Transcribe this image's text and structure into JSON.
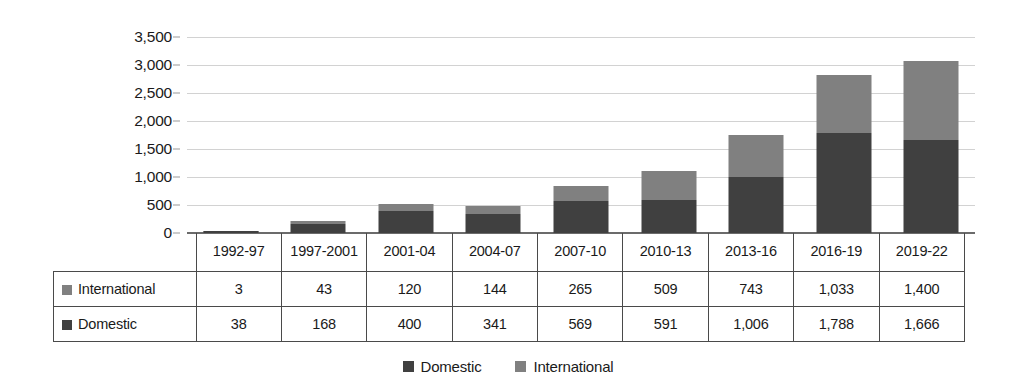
{
  "chart_data": {
    "type": "bar",
    "subtype": "stacked-column",
    "title": "",
    "subtitle": "",
    "xlabel": "",
    "ylabel": "",
    "categories": [
      "1992-97",
      "1997-2001",
      "2001-04",
      "2004-07",
      "2007-10",
      "2010-13",
      "2013-16",
      "2016-19",
      "2019-22"
    ],
    "series": [
      {
        "name": "Domestic",
        "color": "#404040",
        "values": [
          38,
          168,
          400,
          341,
          569,
          591,
          1006,
          1788,
          1666
        ],
        "labels": [
          "38",
          "168",
          "400",
          "341",
          "569",
          "591",
          "1,006",
          "1,788",
          "1,666"
        ]
      },
      {
        "name": "International",
        "color": "#808080",
        "values": [
          3,
          43,
          120,
          144,
          265,
          509,
          743,
          1033,
          1400
        ],
        "labels": [
          "3",
          "43",
          "120",
          "144",
          "265",
          "509",
          "743",
          "1,033",
          "1,400"
        ]
      }
    ],
    "totals": [
      41,
      211,
      520,
      485,
      834,
      1100,
      1749,
      2821,
      3066
    ],
    "ylim": [
      0,
      3500
    ],
    "y_ticks": [
      0,
      500,
      1000,
      1500,
      2000,
      2500,
      3000,
      3500
    ],
    "y_tick_labels": [
      "0",
      "500",
      "1,000",
      "1,500",
      "2,000",
      "2,500",
      "3,000",
      "3,500"
    ],
    "grid": true,
    "grid_axis": "y",
    "legend_position": "bottom",
    "stack_order_bottom_to_top": [
      "Domestic",
      "International"
    ]
  },
  "table": {
    "header_label": "",
    "columns": [
      "1992-97",
      "1997-2001",
      "2001-04",
      "2004-07",
      "2007-10",
      "2010-13",
      "2013-16",
      "2016-19",
      "2019-22"
    ],
    "rows": [
      {
        "label": "International",
        "swatch_color": "#808080",
        "values": [
          "3",
          "43",
          "120",
          "144",
          "265",
          "509",
          "743",
          "1,033",
          "1,400"
        ]
      },
      {
        "label": "Domestic",
        "swatch_color": "#404040",
        "values": [
          "38",
          "168",
          "400",
          "341",
          "569",
          "591",
          "1,006",
          "1,788",
          "1,666"
        ]
      }
    ]
  },
  "legend": {
    "items": [
      {
        "label": "Domestic",
        "color": "#404040"
      },
      {
        "label": "International",
        "color": "#808080"
      }
    ]
  },
  "colors": {
    "domestic": "#404040",
    "international": "#808080",
    "gridline": "#d2d2d2",
    "axis": "#6b6b6b",
    "text": "#1a1a1a",
    "table_border": "#4a4a4a",
    "background": "#ffffff"
  }
}
